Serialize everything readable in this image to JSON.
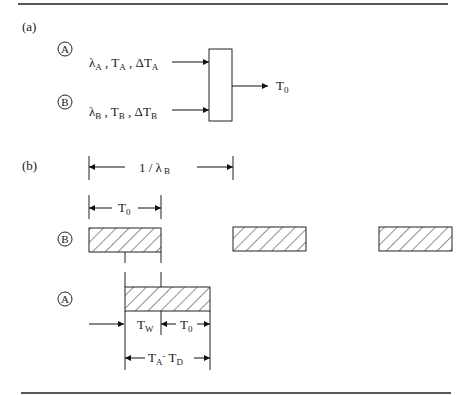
{
  "figure": {
    "panel_a": {
      "label": "(a)",
      "inputs": [
        {
          "circle": "A",
          "lambda_sub": "A",
          "t": "T",
          "t_sub": "A",
          "dt": "ΔT",
          "dt_sub": "A"
        },
        {
          "circle": "B",
          "lambda_sub": "B",
          "t": "T",
          "t_sub": "B",
          "dt": "ΔT",
          "dt_sub": "B"
        }
      ],
      "lambda": "λ",
      "sep": ",",
      "output": {
        "t": "T",
        "sub": "0"
      }
    },
    "panel_b": {
      "label": "(b)",
      "period": {
        "text": "1 / λ",
        "sub": "B"
      },
      "t0_dim": {
        "t": "T",
        "sub": "0"
      },
      "row_b": {
        "circle": "B"
      },
      "row_a": {
        "circle": "A"
      },
      "tw": {
        "t": "T",
        "sub": "W"
      },
      "t0_right": {
        "t": "T",
        "sub": "0"
      },
      "ta_td": {
        "t1": "T",
        "sub1": "A",
        "minus": "-",
        "t2": "T",
        "sub2": "D"
      }
    }
  }
}
